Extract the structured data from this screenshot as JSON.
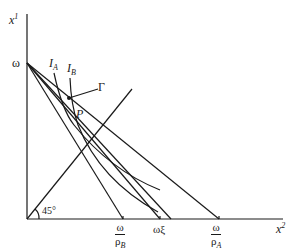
{
  "diagram": {
    "axes": {
      "y_label": "x",
      "y_label_sup": "1",
      "x_label": "x",
      "x_label_sup": "2"
    },
    "endowment_label": "ω",
    "angle_label": "45°",
    "curve_labels": {
      "IA": {
        "main": "I",
        "sub": "A"
      },
      "IB": {
        "main": "I",
        "sub": "B"
      }
    },
    "point_labels": {
      "gamma": "Γ",
      "P": "P"
    },
    "x_intercepts": {
      "omega_rhoB": {
        "num": "ω",
        "den_main": "ρ",
        "den_sub": "B"
      },
      "omega_xi": "ωξ",
      "omega_rhoA": {
        "num": "ω",
        "den_main": "ρ",
        "den_sub": "A"
      }
    },
    "colors": {
      "stroke": "#1a1a1a",
      "background": "#ffffff"
    }
  }
}
